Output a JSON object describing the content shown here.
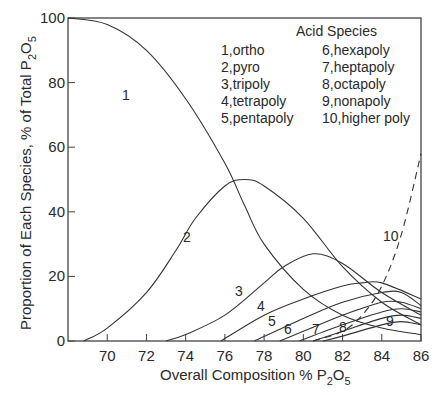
{
  "chart_data": {
    "type": "line",
    "title": "",
    "xlabel": "Overall Composition % P2O5",
    "ylabel": "Proportion of Each Species, % of Total P2O5",
    "xlim": [
      68,
      86
    ],
    "ylim": [
      0,
      100
    ],
    "x_ticks": [
      70,
      72,
      74,
      76,
      78,
      80,
      82,
      84,
      86
    ],
    "y_ticks": [
      0,
      20,
      40,
      60,
      80,
      100
    ],
    "grid": false,
    "legend": {
      "title": "Acid Species",
      "position": "upper right",
      "entries": [
        "1, ortho",
        "2, pyro",
        "3, tripoly",
        "4, tetrapoly",
        "5, pentapoly",
        "6, hexapoly",
        "7, heptapoly",
        "8, octapoly",
        "9, nonapoly",
        "10, higher poly"
      ]
    },
    "series": [
      {
        "name": "1",
        "label": "ortho",
        "style": "solid",
        "x": [
          68,
          70,
          72,
          74,
          76,
          77,
          78,
          80,
          82,
          84,
          86
        ],
        "y": [
          100,
          98,
          90,
          75,
          55,
          42,
          30,
          16,
          8,
          4,
          2
        ]
      },
      {
        "name": "2",
        "label": "pyro",
        "style": "solid",
        "x": [
          68.8,
          70,
          72,
          73.5,
          74.5,
          76,
          77,
          78,
          80,
          82,
          84,
          86
        ],
        "y": [
          0,
          4,
          15,
          28,
          38,
          48,
          50,
          48,
          38,
          23,
          12,
          5
        ]
      },
      {
        "name": "3",
        "label": "tripoly",
        "style": "solid",
        "x": [
          73,
          74,
          76,
          78,
          79,
          80.5,
          82,
          84,
          86
        ],
        "y": [
          0,
          2,
          8,
          18,
          23,
          27,
          24,
          15,
          8
        ]
      },
      {
        "name": "4",
        "label": "tetrapoly",
        "style": "solid",
        "x": [
          75.8,
          78,
          80,
          82,
          83,
          84,
          86
        ],
        "y": [
          0,
          8,
          13,
          17,
          18,
          18,
          13
        ]
      },
      {
        "name": "5",
        "label": "pentapoly",
        "style": "solid",
        "x": [
          77.5,
          80,
          82,
          84,
          85,
          86
        ],
        "y": [
          0,
          7,
          12,
          15,
          15,
          11
        ]
      },
      {
        "name": "6",
        "label": "hexapoly",
        "style": "solid",
        "x": [
          78.8,
          80,
          82,
          84,
          85,
          86
        ],
        "y": [
          0,
          3,
          8,
          12,
          12,
          10
        ]
      },
      {
        "name": "7",
        "label": "heptapoly",
        "style": "solid",
        "x": [
          79.8,
          82,
          84,
          85,
          86
        ],
        "y": [
          0,
          5,
          9,
          10,
          9
        ]
      },
      {
        "name": "8",
        "label": "octapoly",
        "style": "solid",
        "x": [
          80.5,
          82,
          84,
          85,
          86
        ],
        "y": [
          0,
          3,
          7,
          8,
          7
        ]
      },
      {
        "name": "9",
        "label": "nonapoly",
        "style": "solid",
        "x": [
          81,
          82,
          84,
          85,
          86
        ],
        "y": [
          0,
          1.5,
          5,
          6,
          5
        ]
      },
      {
        "name": "10",
        "label": "higher poly",
        "style": "dashed",
        "x": [
          80.5,
          82,
          83,
          84,
          85,
          86
        ],
        "y": [
          0,
          3,
          8,
          17,
          33,
          58
        ]
      }
    ]
  }
}
